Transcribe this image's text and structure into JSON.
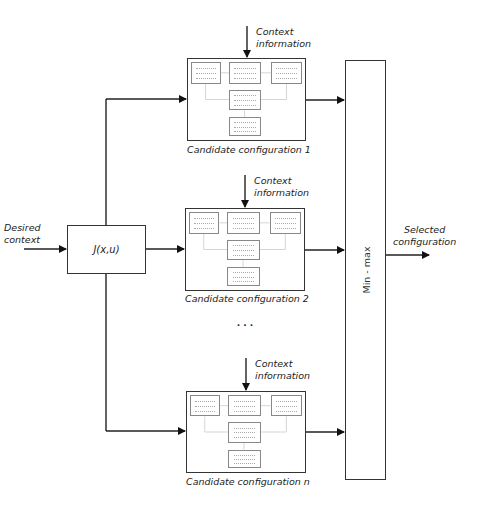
{
  "inputs": {
    "desired_context": [
      "Desired",
      "context"
    ]
  },
  "cost_block": {
    "label": "J(x,u)"
  },
  "candidates": [
    {
      "caption": "Candidate configuration 1",
      "context": [
        "Context",
        "information"
      ]
    },
    {
      "caption": "Candidate configuration 2",
      "context": [
        "Context",
        "information"
      ]
    },
    {
      "caption": "Candidate configuration n",
      "context": [
        "Context",
        "information"
      ]
    }
  ],
  "ellipsis": ". . .",
  "selector": {
    "label": "Min - max"
  },
  "output": {
    "label": [
      "Selected",
      "configuration"
    ]
  },
  "colors": {
    "line": "#222222",
    "box_border": "#333333",
    "mini_border": "#888888"
  }
}
